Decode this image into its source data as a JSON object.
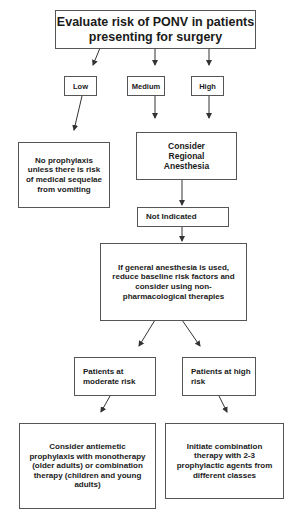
{
  "diagram": {
    "title_box": "Evaluate risk of PONV in patients presenting for surgery",
    "risk_levels": {
      "low": "Low",
      "medium": "Medium",
      "high": "High"
    },
    "low_outcome": "No prophylaxis unless there is risk of medical sequelae from vomiting",
    "consider_regional": "Consider Regional Anesthesia",
    "not_indicated": "Not Indicated",
    "general_anesthesia": "If general anesthesia is used, reduce baseline risk factors and consider using non-pharmacological therapies",
    "moderate_risk": "Patients at moderate risk",
    "high_risk": "Patients at high risk",
    "moderate_outcome": "Consider antiemetic prophylaxis with monotherapy (older adults) or combination therapy (children and young adults)",
    "high_outcome": "Initiate combination therapy with 2-3 prophylactic agents from different classes"
  },
  "colors": {
    "border": "#555555",
    "text": "#1a1a1a",
    "arrow": "#333333"
  }
}
